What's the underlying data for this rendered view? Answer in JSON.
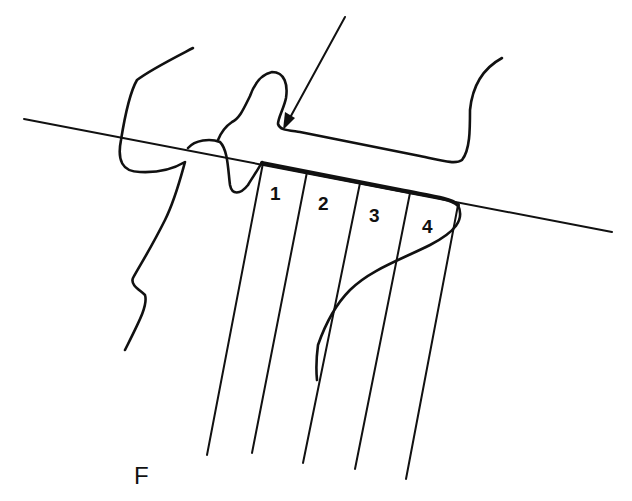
{
  "figure": {
    "panel_label": "F",
    "zone_labels": [
      "1",
      "2",
      "3",
      "4"
    ],
    "colors": {
      "stroke": "#111111",
      "background": "#ffffff"
    }
  }
}
